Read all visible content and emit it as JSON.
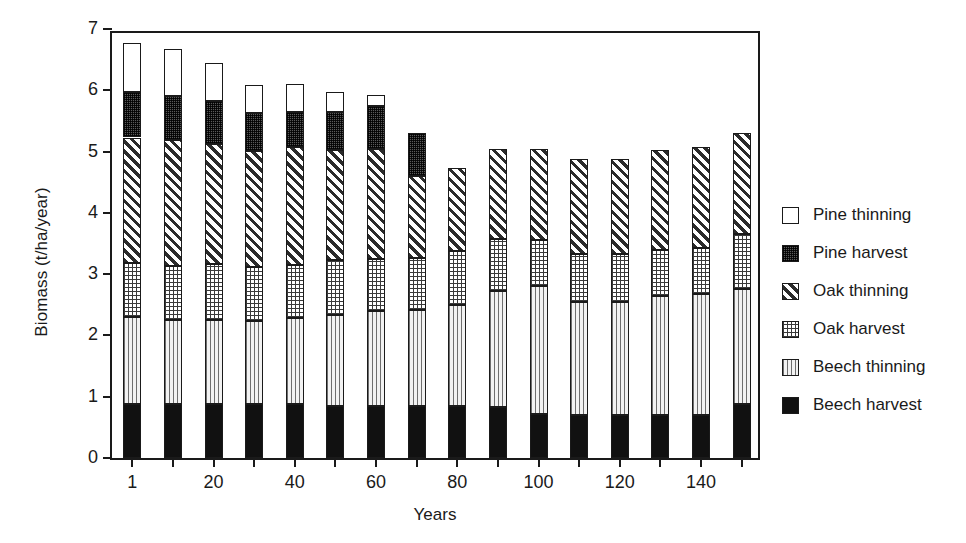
{
  "chart_data": {
    "type": "bar",
    "stacked": true,
    "title": "",
    "xlabel": "Years",
    "ylabel": "Biomass (t/ha/year)",
    "ylim": [
      0,
      7
    ],
    "yticks": [
      0,
      1,
      2,
      3,
      4,
      5,
      6,
      7
    ],
    "xtick_labels": [
      "1",
      "",
      "20",
      "",
      "40",
      "",
      "60",
      "",
      "80",
      "",
      "100",
      "",
      "120",
      "",
      "140",
      ""
    ],
    "categories": [
      1,
      10,
      20,
      30,
      40,
      50,
      60,
      70,
      80,
      90,
      100,
      110,
      120,
      130,
      140,
      150
    ],
    "grid": false,
    "legend_position": "right",
    "series": [
      {
        "name": "Beech harvest",
        "pattern": "solid-black",
        "color": "#111111",
        "values": [
          0.88,
          0.88,
          0.88,
          0.88,
          0.88,
          0.85,
          0.85,
          0.85,
          0.85,
          0.83,
          0.72,
          0.7,
          0.7,
          0.7,
          0.7,
          0.88
        ]
      },
      {
        "name": "Beech thinning",
        "pattern": "vertical-lines",
        "color": "#e8e8e8",
        "values": [
          1.42,
          1.38,
          1.37,
          1.35,
          1.4,
          1.48,
          1.55,
          1.57,
          1.65,
          1.9,
          2.08,
          1.85,
          1.85,
          1.95,
          1.97,
          1.88
        ]
      },
      {
        "name": "Oak harvest",
        "pattern": "fine-checker",
        "color": "#ffffff",
        "values": [
          0.88,
          0.88,
          0.92,
          0.88,
          0.87,
          0.9,
          0.85,
          0.85,
          0.88,
          0.85,
          0.75,
          0.78,
          0.78,
          0.75,
          0.75,
          0.9
        ]
      },
      {
        "name": "Oak thinning",
        "pattern": "diagonal-hatch",
        "color": "#ffffff",
        "values": [
          2.05,
          2.05,
          1.95,
          1.9,
          1.92,
          1.8,
          1.8,
          1.33,
          1.35,
          1.47,
          1.5,
          1.55,
          1.55,
          1.63,
          1.65,
          1.65
        ]
      },
      {
        "name": "Pine harvest",
        "pattern": "dense-dots",
        "color": "#5a5a5a",
        "values": [
          0.75,
          0.72,
          0.7,
          0.62,
          0.58,
          0.62,
          0.7,
          0.7,
          0,
          0,
          0,
          0,
          0,
          0,
          0,
          0
        ]
      },
      {
        "name": "Pine thinning",
        "pattern": "open-white",
        "color": "#ffffff",
        "values": [
          0.8,
          0.77,
          0.63,
          0.45,
          0.45,
          0.33,
          0.18,
          0,
          0,
          0,
          0,
          0,
          0,
          0,
          0,
          0
        ]
      }
    ],
    "totals": [
      5.9,
      5.8,
      5.68,
      5.45,
      5.35,
      5.32,
      5.33,
      5.3,
      4.73,
      5.05,
      5.05,
      4.88,
      4.88,
      5.03,
      5.07,
      5.31
    ]
  },
  "legend": {
    "items": [
      {
        "label": "Pine thinning",
        "swatch": "f-pine-thinning"
      },
      {
        "label": "Pine harvest",
        "swatch": "f-pine-harvest"
      },
      {
        "label": "Oak thinning",
        "swatch": "f-oak-thinning"
      },
      {
        "label": "Oak harvest",
        "swatch": "f-oak-harvest"
      },
      {
        "label": "Beech thinning",
        "swatch": "f-beech-thinning"
      },
      {
        "label": "Beech harvest",
        "swatch": "f-beech-harvest"
      }
    ]
  }
}
